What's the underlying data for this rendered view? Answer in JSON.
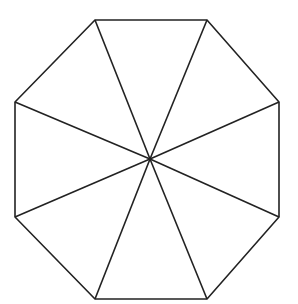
{
  "diagram": {
    "shape": "regular octagon divided into 8 triangles from center",
    "stroke_color": "#222222",
    "fill_color": "#ffffff",
    "stroke_width": 1.6,
    "center": [
      150,
      159
    ],
    "vertices": [
      [
        95,
        20
      ],
      [
        207,
        20
      ],
      [
        279,
        102
      ],
      [
        279,
        217
      ],
      [
        207,
        299
      ],
      [
        95,
        299
      ],
      [
        15,
        217
      ],
      [
        15,
        102
      ]
    ]
  }
}
